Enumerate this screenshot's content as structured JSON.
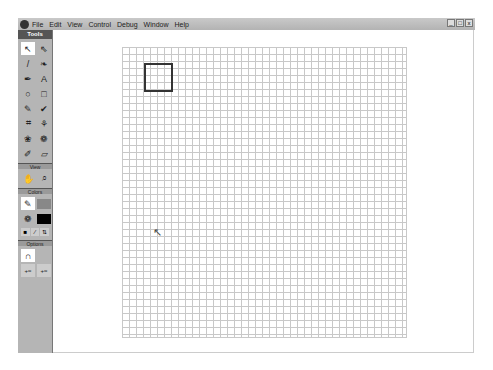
{
  "menubar": {
    "items": [
      "File",
      "Edit",
      "View",
      "Control",
      "Debug",
      "Window",
      "Help"
    ],
    "window_buttons": [
      "_",
      "□",
      "x"
    ]
  },
  "toolbox": {
    "title": "Tools",
    "tools": [
      {
        "name": "arrow-tool",
        "glyph": "↖"
      },
      {
        "name": "subselect-tool",
        "glyph": "⇖"
      },
      {
        "name": "line-tool",
        "glyph": "/"
      },
      {
        "name": "lasso-tool",
        "glyph": "❧"
      },
      {
        "name": "pen-tool",
        "glyph": "✒"
      },
      {
        "name": "text-tool",
        "glyph": "A"
      },
      {
        "name": "oval-tool",
        "glyph": "○"
      },
      {
        "name": "rectangle-tool",
        "glyph": "□"
      },
      {
        "name": "pencil-tool",
        "glyph": "✎"
      },
      {
        "name": "brush-tool",
        "glyph": "✔"
      },
      {
        "name": "free-transform-tool",
        "glyph": "⌗"
      },
      {
        "name": "fill-transform-tool",
        "glyph": "⚘"
      },
      {
        "name": "ink-bottle-tool",
        "glyph": "❀"
      },
      {
        "name": "paint-bucket-tool",
        "glyph": "❁"
      },
      {
        "name": "eyedropper-tool",
        "glyph": "✐"
      },
      {
        "name": "eraser-tool",
        "glyph": "▱"
      }
    ],
    "view_label": "View",
    "view_tools": [
      {
        "name": "hand-tool",
        "glyph": "✋"
      },
      {
        "name": "zoom-tool",
        "glyph": "⌕"
      }
    ],
    "colors_label": "Colors",
    "color_tools": [
      {
        "name": "stroke-color",
        "glyph": "✎",
        "swatch": "#888888"
      },
      {
        "name": "fill-color",
        "glyph": "❁",
        "swatch": "#000000"
      }
    ],
    "color_buttons": [
      "■",
      "∕",
      "⇅"
    ],
    "options_label": "Options",
    "option_tools": [
      {
        "name": "snap-magnet",
        "glyph": "∩"
      }
    ],
    "option_buttons": [
      "+≈",
      "+≈"
    ]
  },
  "stage": {
    "grid_color": "#c8c8c8",
    "square_stroke": "#333333"
  }
}
